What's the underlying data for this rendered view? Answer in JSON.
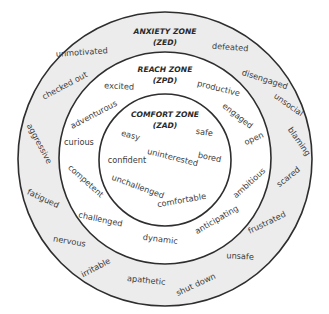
{
  "colors": {
    "outer_ring_fill": "#ececec",
    "middle_ring_fill": "#ffffff",
    "inner_circle_fill": "#ffffff",
    "outline": "#2e2e2e",
    "text": "#3c3c3c"
  },
  "zones": {
    "anxiety": {
      "title": "ANXIETY ZONE",
      "code": "(ZED)",
      "words": [
        "unmotivated",
        "defeated",
        "checked out",
        "disengaged",
        "unsocial",
        "aggressive",
        "blaming",
        "fatigued",
        "scared",
        "nervous",
        "frustrated",
        "irritable",
        "unsafe",
        "apathetic",
        "shut down"
      ]
    },
    "reach": {
      "title": "REACH ZONE",
      "code": "(ZPD)",
      "words": [
        "excited",
        "productive",
        "adventurous",
        "engaged",
        "curious",
        "open",
        "competent",
        "ambitious",
        "challenged",
        "anticipating",
        "dynamic"
      ]
    },
    "comfort": {
      "title": "COMFORT ZONE",
      "code": "(ZAD)",
      "words": [
        "easy",
        "safe",
        "confident",
        "uninterested",
        "bored",
        "unchallenged",
        "comfortable"
      ]
    }
  }
}
